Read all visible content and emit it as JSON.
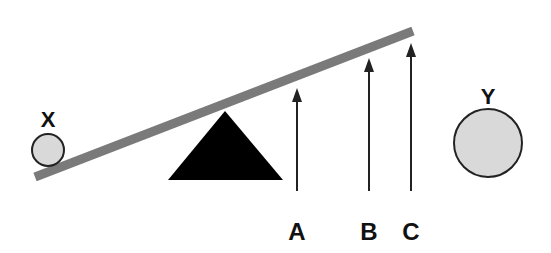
{
  "diagram": {
    "colors": {
      "beam": "#7a7a7a",
      "fulcrum": "#000000",
      "ball_fill": "#d9d9d9",
      "ball_stroke": "#222222",
      "arrow": "#222222",
      "label": "#111111"
    },
    "balls": [
      {
        "id": "X",
        "label": "X",
        "size": "small"
      },
      {
        "id": "Y",
        "label": "Y",
        "size": "large"
      }
    ],
    "arrows": [
      {
        "id": "A",
        "label": "A"
      },
      {
        "id": "B",
        "label": "B"
      },
      {
        "id": "C",
        "label": "C"
      }
    ],
    "fulcrum": {
      "shape": "triangle"
    },
    "beam": {
      "shape": "inclined-plank"
    }
  }
}
